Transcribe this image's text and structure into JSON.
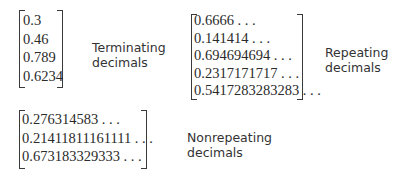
{
  "groups": [
    {
      "id": "terminating",
      "label_line1": "Terminating",
      "label_line2": "decimals",
      "values": [
        "0.3",
        "0.46",
        "0.789",
        "0.6234"
      ]
    },
    {
      "id": "repeating",
      "label_line1": "Repeating",
      "label_line2": "decimals",
      "values": [
        "0.6666 . . .",
        "0.141414 . . .",
        "0.694694694 . . .",
        "0.2317171717 . . .",
        "0.5417283283283 . . ."
      ]
    },
    {
      "id": "nonrepeating",
      "label_line1": "Nonrepeating",
      "label_line2": "decimals",
      "values": [
        "0.276314583 . . .",
        "0.21411811161111 . . .",
        "0.673183329333 . . ."
      ]
    }
  ]
}
